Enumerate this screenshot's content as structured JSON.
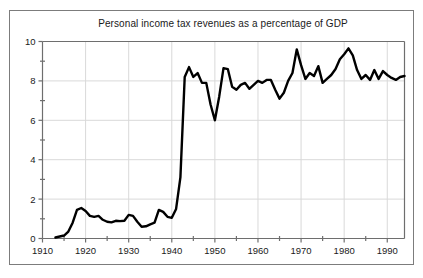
{
  "figure": {
    "title": "Personal income tax revenues as a percentage of GDP",
    "background_color": "#ffffff",
    "frame_color": "#7c7c7c",
    "line_color": "#000000",
    "grid_color": "#d9d9d9"
  },
  "chart_data": {
    "type": "line",
    "title": "Personal income tax revenues as a percentage of GDP",
    "xlabel": "",
    "ylabel": "",
    "xlim": [
      1910,
      1994
    ],
    "ylim": [
      0,
      10
    ],
    "grid": true,
    "legend": "none",
    "x_ticks": [
      1910,
      1920,
      1930,
      1940,
      1950,
      1960,
      1970,
      1980,
      1990
    ],
    "x_tick_labels": [
      "1910",
      "1920",
      "1930",
      "1940",
      "1950",
      "1960",
      "1970",
      "1980",
      "1990"
    ],
    "x_minor_ticks": [
      1915,
      1925,
      1935,
      1945,
      1955,
      1965,
      1975,
      1985
    ],
    "y_ticks": [
      0,
      2,
      4,
      6,
      8,
      10
    ],
    "y_tick_labels": [
      "0",
      "2",
      "4",
      "6",
      "8",
      "10"
    ],
    "y_minor_ticks": [
      1,
      3,
      5,
      7,
      9
    ],
    "series": [
      {
        "name": "Personal income tax revenues (% of GDP)",
        "x": [
          1913,
          1914,
          1915,
          1916,
          1917,
          1918,
          1919,
          1920,
          1921,
          1922,
          1923,
          1924,
          1925,
          1926,
          1927,
          1928,
          1929,
          1930,
          1931,
          1932,
          1933,
          1934,
          1935,
          1936,
          1937,
          1938,
          1939,
          1940,
          1941,
          1942,
          1943,
          1944,
          1945,
          1946,
          1947,
          1948,
          1949,
          1950,
          1951,
          1952,
          1953,
          1954,
          1955,
          1956,
          1957,
          1958,
          1959,
          1960,
          1961,
          1962,
          1963,
          1964,
          1965,
          1966,
          1967,
          1968,
          1969,
          1970,
          1971,
          1972,
          1973,
          1974,
          1975,
          1976,
          1977,
          1978,
          1979,
          1980,
          1981,
          1982,
          1983,
          1984,
          1985,
          1986,
          1987,
          1988,
          1989,
          1990,
          1991,
          1992,
          1993,
          1994
        ],
        "y": [
          0.05,
          0.1,
          0.15,
          0.35,
          0.8,
          1.45,
          1.55,
          1.4,
          1.15,
          1.1,
          1.15,
          0.95,
          0.85,
          0.82,
          0.9,
          0.88,
          0.9,
          1.2,
          1.15,
          0.85,
          0.6,
          0.62,
          0.72,
          0.8,
          1.45,
          1.35,
          1.1,
          1.05,
          1.5,
          3.1,
          8.2,
          8.7,
          8.2,
          8.4,
          7.9,
          7.9,
          6.8,
          6.0,
          7.2,
          8.65,
          8.6,
          7.7,
          7.55,
          7.8,
          7.9,
          7.6,
          7.8,
          8.0,
          7.9,
          8.05,
          8.05,
          7.55,
          7.1,
          7.4,
          8.0,
          8.4,
          9.6,
          8.8,
          8.1,
          8.4,
          8.25,
          8.75,
          7.9,
          8.1,
          8.3,
          8.6,
          9.1,
          9.35,
          9.65,
          9.3,
          8.55,
          8.1,
          8.3,
          8.05,
          8.55,
          8.1,
          8.5,
          8.3,
          8.15,
          8.05,
          8.2,
          8.25
        ]
      }
    ]
  },
  "axes": {
    "y_axis_label_top": "10",
    "x_axis_label_left": "1910"
  }
}
